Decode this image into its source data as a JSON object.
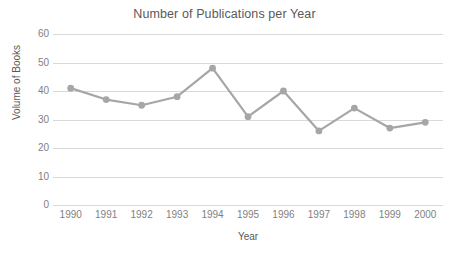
{
  "chart_data": {
    "type": "line",
    "title": "Number of Publications per Year",
    "xlabel": "Year",
    "ylabel": "Volume of Books",
    "categories": [
      "1990",
      "1991",
      "1992",
      "1993",
      "1994",
      "1995",
      "1996",
      "1997",
      "1998",
      "1999",
      "2000"
    ],
    "values": [
      41,
      37,
      35,
      38,
      48,
      31,
      40,
      26,
      34,
      27,
      29
    ],
    "ylim": [
      0,
      60
    ],
    "yticks": [
      0,
      10,
      20,
      30,
      40,
      50,
      60
    ],
    "ytick_labels": [
      "0",
      "10",
      "20",
      "30",
      "40",
      "50",
      "60"
    ],
    "grid": true,
    "legend": false,
    "series_color": "#a6a6a6",
    "marker": "circle",
    "gridline_color": "#d9d9d9",
    "text_color": "#595959",
    "tick_color": "#7f7f7f",
    "background": "#ffffff"
  }
}
